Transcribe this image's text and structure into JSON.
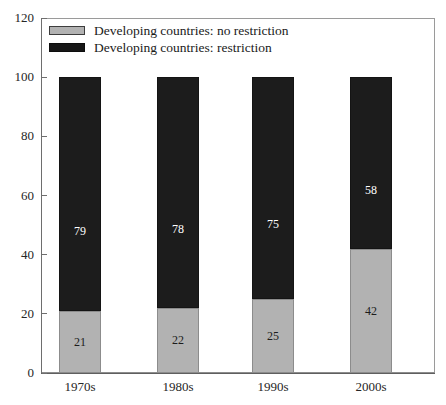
{
  "figure": {
    "caption_remnant": "",
    "background_color": "#ffffff"
  },
  "legend": {
    "position": "top-left-inside",
    "entries": [
      {
        "label": "Developing countries: no restriction",
        "color": "#b2b2b2",
        "swatch": "light-gray-swatch"
      },
      {
        "label": "Developing countries: restriction",
        "color": "#171717",
        "swatch": "dark-swatch"
      }
    ]
  },
  "axes": {
    "y_ticks": [
      "120",
      "100",
      "80",
      "60",
      "40",
      "20",
      "0"
    ],
    "x_ticks": [
      "1970s",
      "1980s",
      "1990s",
      "2000s"
    ]
  },
  "chart_data": {
    "type": "bar",
    "subtype": "stacked-bar",
    "title": "",
    "subtitle": "",
    "xlabel": "",
    "ylabel": "",
    "ylim": [
      0,
      120
    ],
    "ytick_step": 20,
    "grid": false,
    "legend_position": "top-left-inside",
    "categories": [
      "1970s",
      "1980s",
      "1990s",
      "2000s"
    ],
    "series": [
      {
        "name": "Developing countries: no restriction",
        "color": "#b2b2b2",
        "stack_order": "bottom",
        "values": [
          21,
          22,
          25,
          42
        ],
        "labels": [
          "21",
          "22",
          "25",
          "42"
        ]
      },
      {
        "name": "Developing countries: restriction",
        "color": "#1c1c1c",
        "stack_order": "top",
        "values": [
          79,
          78,
          75,
          58
        ],
        "labels": [
          "79",
          "78",
          "75",
          "58"
        ]
      }
    ],
    "totals": [
      100,
      100,
      100,
      100
    ]
  }
}
